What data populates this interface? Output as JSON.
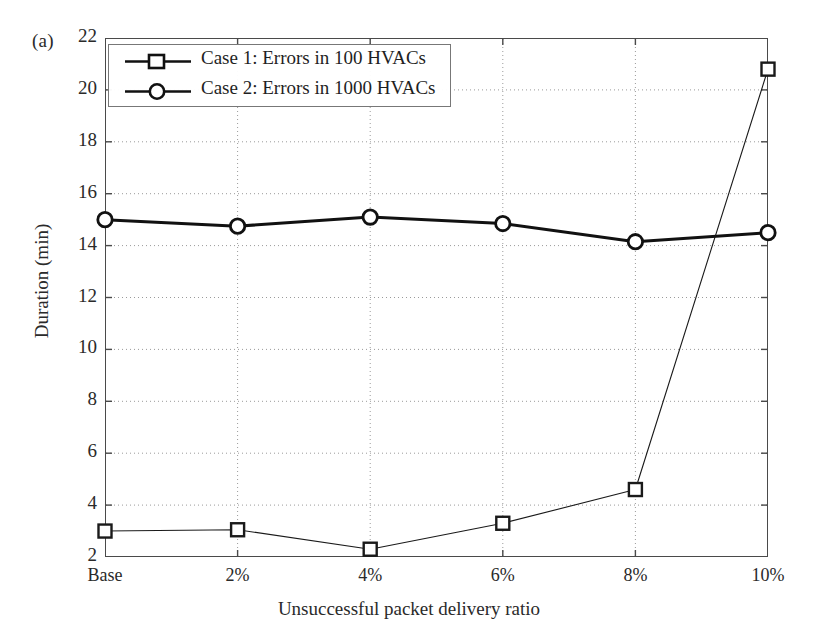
{
  "panel": {
    "label": "(a)"
  },
  "chart_data": {
    "type": "line",
    "title": "",
    "xlabel": "Unsuccessful packet delivery ratio",
    "ylabel": "Duration (min)",
    "categories": [
      "Base",
      "2%",
      "4%",
      "6%",
      "8%",
      "10%"
    ],
    "xtick_labels": [
      "Base",
      "2%",
      "4%",
      "6%",
      "8%",
      "10%"
    ],
    "ytick_labels": [
      "2",
      "4",
      "6",
      "8",
      "10",
      "12",
      "14",
      "16",
      "18",
      "20",
      "22"
    ],
    "yticks": [
      2,
      4,
      6,
      8,
      10,
      12,
      14,
      16,
      18,
      20,
      22
    ],
    "ylim": [
      2,
      22
    ],
    "xlim": [
      0,
      5
    ],
    "grid": true,
    "grid_style": "dotted",
    "legend_position": "upper-left",
    "series": [
      {
        "name": "Case 1: Errors in 100 HVACs",
        "marker": "square",
        "line_width": 1.1,
        "color": "#1a1a1a",
        "values": [
          3.0,
          3.05,
          2.3,
          3.3,
          4.6,
          20.8
        ]
      },
      {
        "name": "Case 2: Errors in 1000 HVACs",
        "marker": "circle",
        "line_width": 3.0,
        "color": "#111111",
        "values": [
          15.0,
          14.75,
          15.1,
          14.85,
          14.15,
          14.5
        ]
      }
    ]
  },
  "colors": {
    "axis": "#4a4a4a",
    "grid": "#9a9a9a",
    "series1": "#1a1a1a",
    "series2": "#111111",
    "background": "#ffffff"
  }
}
